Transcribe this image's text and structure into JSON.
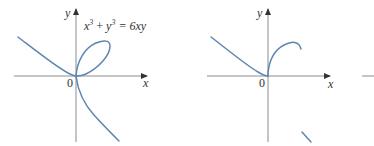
{
  "figures": [
    {
      "id": "left",
      "equation": {
        "base1": "x",
        "exp1": "3",
        "plus": " + ",
        "base2": "y",
        "exp2": "3",
        "rhs": " = 6xy"
      },
      "axis_labels": {
        "x": "x",
        "y": "y",
        "origin": "0"
      },
      "colors": {
        "curve": "#5b86b0",
        "axis": "#8c8c8c"
      }
    },
    {
      "id": "right",
      "axis_labels": {
        "x": "x",
        "y": "y",
        "origin": "0"
      },
      "colors": {
        "curve": "#5b86b0",
        "axis": "#8c8c8c"
      }
    }
  ]
}
